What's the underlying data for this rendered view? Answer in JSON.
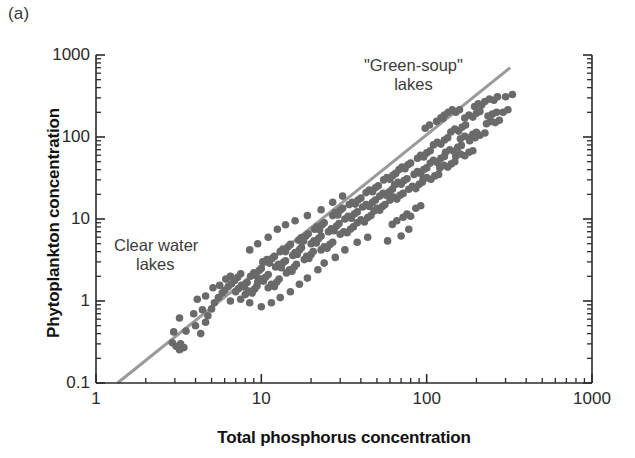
{
  "panel": {
    "label": "(a)"
  },
  "axes": {
    "x_title": "Total phosphorus concentration",
    "y_title": "Phytoplankton concentration",
    "x_ticks": [
      "1",
      "10",
      "100",
      "1000"
    ],
    "y_ticks": [
      "0.1",
      "1",
      "10",
      "100",
      "1000"
    ]
  },
  "annotations": {
    "clear_water_line1": "Clear water",
    "clear_water_line2": "lakes",
    "green_soup_line1": "\"Green-soup\"",
    "green_soup_line2": "lakes"
  },
  "colors": {
    "point": "#6a6a6a",
    "line": "#9a9a9a",
    "axis": "#2a2a2a",
    "text": "#1a1a1a",
    "background": "#ffffff"
  },
  "chart_data": {
    "type": "scatter",
    "title": "",
    "xlabel": "Total phosphorus concentration",
    "ylabel": "Phytoplankton concentration",
    "xscale": "log",
    "yscale": "log",
    "xlim": [
      1,
      1000
    ],
    "ylim": [
      0.1,
      1000
    ],
    "grid": false,
    "legend": null,
    "marker": {
      "shape": "circle",
      "size_px": 7.6,
      "color": "#6a6a6a"
    },
    "trendline": {
      "type": "power-law",
      "color": "#9a9a9a",
      "width_px": 3,
      "x_start": 1.35,
      "y_start": 0.1,
      "x_end": 320,
      "y_end": 700,
      "slope_loglog": 1.45
    },
    "annotations": [
      {
        "text": "Clear water lakes",
        "x": 2.3,
        "y": 4.5
      },
      {
        "text": "\"Green-soup\" lakes",
        "x": 62,
        "y": 560
      }
    ],
    "points": [
      [
        2.9,
        0.31
      ],
      [
        3.05,
        0.28
      ],
      [
        3.2,
        0.255
      ],
      [
        3.25,
        0.3
      ],
      [
        3.4,
        0.27
      ],
      [
        2.95,
        0.42
      ],
      [
        3.5,
        0.43
      ],
      [
        4.0,
        0.5
      ],
      [
        4.3,
        0.4
      ],
      [
        4.6,
        0.55
      ],
      [
        3.2,
        0.62
      ],
      [
        3.9,
        0.7
      ],
      [
        4.4,
        0.78
      ],
      [
        4.75,
        0.66
      ],
      [
        5.0,
        0.8
      ],
      [
        4.1,
        1.05
      ],
      [
        4.6,
        1.15
      ],
      [
        5.2,
        0.95
      ],
      [
        5.5,
        1.1
      ],
      [
        5.8,
        1.25
      ],
      [
        5.1,
        1.45
      ],
      [
        5.6,
        1.55
      ],
      [
        6.0,
        1.35
      ],
      [
        6.3,
        1.5
      ],
      [
        6.6,
        1.62
      ],
      [
        6.1,
        1.85
      ],
      [
        6.5,
        2.0
      ],
      [
        6.9,
        1.78
      ],
      [
        7.2,
        1.95
      ],
      [
        7.5,
        2.15
      ],
      [
        7.0,
        1.3
      ],
      [
        7.3,
        1.42
      ],
      [
        7.6,
        1.55
      ],
      [
        7.9,
        1.48
      ],
      [
        8.2,
        1.68
      ],
      [
        8.0,
        1.2
      ],
      [
        8.4,
        1.32
      ],
      [
        8.8,
        1.25
      ],
      [
        9.1,
        1.4
      ],
      [
        9.4,
        1.52
      ],
      [
        8.6,
        2.0
      ],
      [
        9.0,
        2.2
      ],
      [
        9.3,
        2.05
      ],
      [
        9.7,
        2.35
      ],
      [
        10.0,
        2.5
      ],
      [
        9.5,
        1.7
      ],
      [
        9.9,
        1.85
      ],
      [
        10.3,
        1.75
      ],
      [
        10.6,
        1.95
      ],
      [
        11.0,
        2.1
      ],
      [
        10.2,
        3.0
      ],
      [
        10.8,
        3.2
      ],
      [
        11.2,
        2.9
      ],
      [
        11.6,
        3.3
      ],
      [
        12.0,
        3.5
      ],
      [
        11.0,
        1.45
      ],
      [
        11.5,
        1.6
      ],
      [
        12.0,
        1.5
      ],
      [
        12.4,
        1.7
      ],
      [
        12.8,
        1.85
      ],
      [
        12.2,
        2.6
      ],
      [
        12.7,
        2.8
      ],
      [
        13.2,
        2.55
      ],
      [
        13.6,
        2.95
      ],
      [
        14.0,
        3.1
      ],
      [
        13.0,
        4.0
      ],
      [
        13.5,
        4.3
      ],
      [
        14.0,
        4.0
      ],
      [
        14.5,
        4.6
      ],
      [
        15.0,
        4.9
      ],
      [
        14.2,
        2.2
      ],
      [
        14.8,
        2.4
      ],
      [
        15.3,
        2.3
      ],
      [
        15.8,
        2.6
      ],
      [
        16.3,
        2.8
      ],
      [
        15.5,
        3.6
      ],
      [
        16.0,
        3.9
      ],
      [
        16.5,
        3.7
      ],
      [
        17.0,
        4.2
      ],
      [
        17.5,
        4.5
      ],
      [
        16.8,
        5.5
      ],
      [
        17.4,
        5.9
      ],
      [
        18.0,
        5.4
      ],
      [
        18.6,
        6.2
      ],
      [
        19.2,
        6.6
      ],
      [
        18.2,
        3.2
      ],
      [
        18.8,
        3.5
      ],
      [
        19.4,
        3.3
      ],
      [
        20.0,
        3.7
      ],
      [
        20.6,
        4.0
      ],
      [
        20.0,
        5.0
      ],
      [
        20.8,
        5.4
      ],
      [
        21.5,
        5.1
      ],
      [
        22.2,
        5.8
      ],
      [
        23.0,
        6.2
      ],
      [
        21.0,
        7.5
      ],
      [
        21.8,
        8.0
      ],
      [
        22.5,
        7.4
      ],
      [
        23.3,
        8.5
      ],
      [
        24.0,
        9.0
      ],
      [
        23.0,
        4.2
      ],
      [
        24.0,
        4.6
      ],
      [
        25.0,
        4.4
      ],
      [
        26.0,
        4.9
      ],
      [
        27.0,
        5.2
      ],
      [
        25.5,
        7.0
      ],
      [
        26.5,
        7.6
      ],
      [
        27.5,
        7.2
      ],
      [
        28.5,
        8.2
      ],
      [
        29.5,
        8.8
      ],
      [
        27.0,
        11.0
      ],
      [
        28.0,
        12.0
      ],
      [
        29.0,
        11.2
      ],
      [
        30.0,
        12.8
      ],
      [
        31.0,
        13.5
      ],
      [
        30.0,
        6.5
      ],
      [
        31.5,
        7.0
      ],
      [
        33.0,
        6.8
      ],
      [
        34.5,
        7.5
      ],
      [
        36.0,
        8.0
      ],
      [
        32.0,
        10.0
      ],
      [
        33.5,
        10.8
      ],
      [
        35.0,
        10.2
      ],
      [
        36.5,
        11.5
      ],
      [
        38.0,
        12.2
      ],
      [
        34.0,
        15.0
      ],
      [
        35.5,
        16.0
      ],
      [
        37.0,
        15.2
      ],
      [
        38.5,
        17.0
      ],
      [
        40.0,
        18.0
      ],
      [
        38.0,
        9.0
      ],
      [
        40.0,
        9.8
      ],
      [
        42.0,
        9.2
      ],
      [
        44.0,
        10.4
      ],
      [
        46.0,
        11.0
      ],
      [
        41.0,
        14.0
      ],
      [
        43.0,
        15.0
      ],
      [
        45.0,
        14.2
      ],
      [
        47.0,
        16.0
      ],
      [
        49.0,
        17.0
      ],
      [
        43.0,
        21.0
      ],
      [
        45.0,
        22.5
      ],
      [
        47.0,
        21.5
      ],
      [
        49.0,
        24.0
      ],
      [
        51.0,
        25.5
      ],
      [
        48.0,
        12.5
      ],
      [
        50.0,
        13.5
      ],
      [
        52.0,
        12.8
      ],
      [
        54.0,
        14.2
      ],
      [
        56.0,
        15.0
      ],
      [
        52.0,
        19.0
      ],
      [
        54.5,
        20.5
      ],
      [
        57.0,
        19.5
      ],
      [
        59.5,
        21.5
      ],
      [
        62.0,
        23.0
      ],
      [
        55.0,
        30.0
      ],
      [
        57.5,
        32.0
      ],
      [
        60.0,
        30.5
      ],
      [
        62.5,
        34.0
      ],
      [
        65.0,
        36.0
      ],
      [
        60.0,
        17.0
      ],
      [
        63.0,
        18.5
      ],
      [
        66.0,
        17.5
      ],
      [
        69.0,
        19.5
      ],
      [
        72.0,
        20.5
      ],
      [
        64.0,
        26.0
      ],
      [
        67.0,
        28.0
      ],
      [
        70.0,
        26.5
      ],
      [
        73.0,
        29.5
      ],
      [
        76.0,
        31.0
      ],
      [
        68.0,
        40.0
      ],
      [
        71.0,
        43.0
      ],
      [
        74.0,
        41.0
      ],
      [
        77.0,
        46.0
      ],
      [
        80.0,
        48.0
      ],
      [
        72.0,
        10.5
      ],
      [
        76.0,
        11.5
      ],
      [
        80.0,
        10.8
      ],
      [
        66.0,
        9.5
      ],
      [
        62.0,
        8.6
      ],
      [
        78.0,
        23.0
      ],
      [
        82.0,
        25.0
      ],
      [
        86.0,
        23.5
      ],
      [
        90.0,
        26.5
      ],
      [
        94.0,
        28.0
      ],
      [
        84.0,
        35.0
      ],
      [
        88.0,
        38.0
      ],
      [
        92.0,
        36.0
      ],
      [
        96.0,
        40.0
      ],
      [
        100.0,
        42.0
      ],
      [
        88.0,
        55.0
      ],
      [
        92.0,
        60.0
      ],
      [
        96.0,
        57.0
      ],
      [
        100.0,
        64.0
      ],
      [
        105.0,
        68.0
      ],
      [
        95.0,
        30.0
      ],
      [
        100.0,
        32.0
      ],
      [
        106.0,
        30.5
      ],
      [
        112.0,
        33.5
      ],
      [
        118.0,
        35.0
      ],
      [
        105.0,
        48.0
      ],
      [
        110.0,
        52.0
      ],
      [
        116.0,
        49.0
      ],
      [
        122.0,
        55.0
      ],
      [
        128.0,
        58.0
      ],
      [
        110.0,
        80.0
      ],
      [
        116.0,
        86.0
      ],
      [
        122.0,
        82.0
      ],
      [
        128.0,
        92.0
      ],
      [
        134.0,
        98.0
      ],
      [
        120.0,
        42.0
      ],
      [
        127.0,
        45.0
      ],
      [
        134.0,
        43.0
      ],
      [
        141.0,
        47.0
      ],
      [
        148.0,
        50.0
      ],
      [
        130.0,
        65.0
      ],
      [
        138.0,
        70.0
      ],
      [
        146.0,
        67.0
      ],
      [
        154.0,
        75.0
      ],
      [
        162.0,
        79.0
      ],
      [
        140.0,
        115.0
      ],
      [
        148.0,
        125.0
      ],
      [
        156.0,
        118.0
      ],
      [
        164.0,
        132.0
      ],
      [
        172.0,
        140.0
      ],
      [
        150.0,
        58.0
      ],
      [
        160.0,
        62.0
      ],
      [
        170.0,
        59.0
      ],
      [
        180.0,
        65.0
      ],
      [
        190.0,
        68.0
      ],
      [
        160.0,
        95.0
      ],
      [
        170.0,
        102.0
      ],
      [
        180.0,
        97.0
      ],
      [
        190.0,
        108.0
      ],
      [
        200.0,
        114.0
      ],
      [
        170.0,
        170.0
      ],
      [
        180.0,
        185.0
      ],
      [
        190.0,
        175.0
      ],
      [
        200.0,
        195.0
      ],
      [
        210.0,
        205.0
      ],
      [
        195.0,
        235.0
      ],
      [
        205.0,
        255.0
      ],
      [
        215.0,
        245.0
      ],
      [
        150.0,
        200.0
      ],
      [
        158.0,
        215.0
      ],
      [
        230.0,
        145.0
      ],
      [
        245.0,
        155.0
      ],
      [
        260.0,
        150.0
      ],
      [
        275.0,
        160.0
      ],
      [
        225.0,
        270.0
      ],
      [
        240.0,
        290.0
      ],
      [
        255.0,
        280.0
      ],
      [
        268.0,
        310.0
      ],
      [
        300.0,
        310.0
      ],
      [
        330.0,
        330.0
      ],
      [
        290.0,
        200.0
      ],
      [
        310.0,
        215.0
      ],
      [
        86.0,
        13.5
      ],
      [
        92.0,
        14.5
      ],
      [
        78.0,
        7.5
      ],
      [
        70.0,
        6.2
      ],
      [
        58.0,
        5.4
      ],
      [
        44.0,
        6.0
      ],
      [
        38.0,
        5.2
      ],
      [
        32.0,
        4.2
      ],
      [
        28.0,
        3.4
      ],
      [
        24.0,
        2.9
      ],
      [
        22.0,
        2.4
      ],
      [
        19.0,
        1.9
      ],
      [
        17.0,
        1.6
      ],
      [
        15.0,
        1.3
      ],
      [
        13.0,
        1.1
      ],
      [
        11.5,
        0.95
      ],
      [
        10.0,
        0.85
      ],
      [
        8.5,
        0.95
      ],
      [
        7.5,
        1.05
      ],
      [
        6.5,
        1.0
      ],
      [
        12.5,
        7.5
      ],
      [
        14.0,
        8.5
      ],
      [
        11.0,
        6.0
      ],
      [
        9.5,
        5.0
      ],
      [
        8.5,
        4.2
      ],
      [
        16.0,
        9.5
      ],
      [
        19.0,
        11.0
      ],
      [
        23.0,
        13.0
      ],
      [
        27.0,
        16.0
      ],
      [
        31.0,
        19.0
      ],
      [
        115.0,
        155.0
      ],
      [
        125.0,
        168.0
      ],
      [
        104.0,
        140.0
      ],
      [
        98.0,
        128.0
      ],
      [
        210.0,
        105.0
      ],
      [
        225.0,
        112.0
      ],
      [
        196.0,
        98.0
      ],
      [
        182.0,
        90.0
      ],
      [
        143.0,
        215.0
      ],
      [
        135.0,
        200.0
      ],
      [
        128.0,
        185.0
      ],
      [
        122.0,
        172.0
      ],
      [
        250.0,
        190.0
      ],
      [
        265.0,
        200.0
      ],
      [
        235.0,
        180.0
      ]
    ]
  }
}
